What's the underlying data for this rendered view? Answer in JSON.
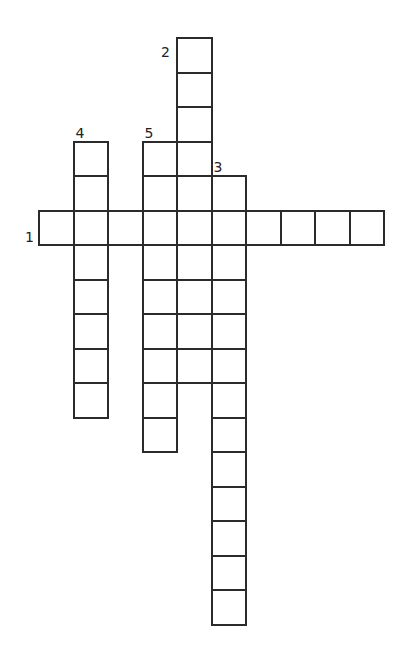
{
  "puzzle": {
    "cell_size": 34.5,
    "origin_x": 38,
    "origin_y": 37,
    "line_color": "#2b2b2b",
    "words": [
      {
        "number": "1",
        "direction": "across",
        "row": 5,
        "col": 0,
        "length": 10
      },
      {
        "number": "2",
        "direction": "down",
        "row": 0,
        "col": 4,
        "length": 10
      },
      {
        "number": "3",
        "direction": "down",
        "row": 4,
        "col": 5,
        "length": 13
      },
      {
        "number": "4",
        "direction": "down",
        "row": 3,
        "col": 1,
        "length": 8
      },
      {
        "number": "5",
        "direction": "down",
        "row": 3,
        "col": 3,
        "length": 9
      }
    ]
  }
}
